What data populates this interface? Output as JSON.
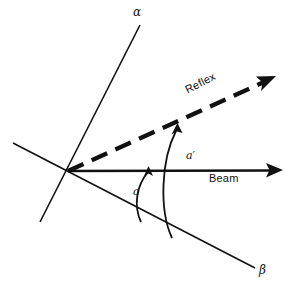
{
  "figure": {
    "type": "geometry-diagram",
    "background_color": "#ffffff",
    "ink_color": "#111111",
    "width": 291,
    "height": 291
  },
  "labels": {
    "alpha": "α",
    "beta": "β",
    "beam": "Beam",
    "reflex": "Reflex",
    "angle_a": "a",
    "angle_a_prime": "a′"
  },
  "elements": {
    "origin": {
      "x": 68,
      "y": 171,
      "name": "vertex"
    },
    "alpha_line": {
      "label": "α",
      "style": "solid",
      "from": {
        "x": 140,
        "y": 25
      },
      "to": {
        "x": 40,
        "y": 222
      }
    },
    "beta_line": {
      "label": "β",
      "style": "solid",
      "from": {
        "x": 13,
        "y": 143
      },
      "to": {
        "x": 255,
        "y": 268
      }
    },
    "beam_arrow": {
      "label": "Beam",
      "style": "solid",
      "arrowhead": "filled-triangle",
      "from": {
        "x": 68,
        "y": 171
      },
      "to": {
        "x": 283,
        "y": 170
      }
    },
    "reflex_arrow": {
      "label": "Reflex",
      "style": "dashed",
      "arrowhead": "filled-triangle",
      "from": {
        "x": 68,
        "y": 171
      },
      "to": {
        "x": 276,
        "y": 76
      }
    },
    "arc_a": {
      "label": "a",
      "description": "angle between beta line and incoming beam",
      "arrowhead": "open-arrow-at-beam-end"
    },
    "arc_a_prime": {
      "label": "a′",
      "description": "angle between beta line and reflected beam",
      "arrowhead": "open-arrow-at-reflex-end"
    }
  }
}
